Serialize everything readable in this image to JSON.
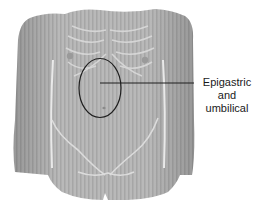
{
  "diagram": {
    "region_highlighted": "epigastric-umbilical",
    "callout": {
      "lines": [
        "Epigastric",
        "and",
        "umbilical"
      ]
    },
    "colors": {
      "skin": "#b8b8b8",
      "skin_dark": "#8e8e8e",
      "skin_light": "#d6d6d6",
      "outline": "#1f1f1f",
      "background": "#ffffff"
    }
  }
}
